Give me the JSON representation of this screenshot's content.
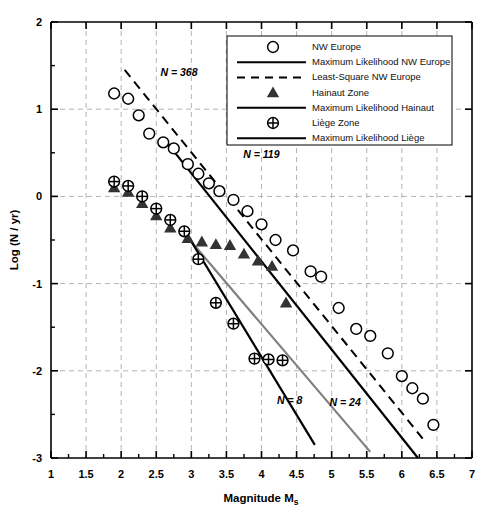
{
  "chart_data": {
    "type": "scatter",
    "title": "",
    "xlabel": "Magnitude Ms",
    "ylabel": "Log (N / yr)",
    "xlim": [
      1,
      7
    ],
    "ylim": [
      -3,
      2
    ],
    "xticks": [
      "1",
      "1.5",
      "2",
      "2.5",
      "3",
      "3.5",
      "4",
      "4.5",
      "5",
      "5.5",
      "6",
      "6.5",
      "7"
    ],
    "yticks": [
      "2",
      "1",
      "0",
      "-1",
      "-2",
      "-3"
    ],
    "grid": true,
    "legend_position": "top-right",
    "series": [
      {
        "name": "NW Europe",
        "marker": "open-circle",
        "color": "#000000",
        "points": [
          [
            1.9,
            1.18
          ],
          [
            2.1,
            1.12
          ],
          [
            2.25,
            0.93
          ],
          [
            2.4,
            0.72
          ],
          [
            2.6,
            0.62
          ],
          [
            2.75,
            0.55
          ],
          [
            2.95,
            0.37
          ],
          [
            3.1,
            0.26
          ],
          [
            3.25,
            0.15
          ],
          [
            3.4,
            0.06
          ],
          [
            3.6,
            -0.04
          ],
          [
            3.8,
            -0.17
          ],
          [
            4.0,
            -0.32
          ],
          [
            4.2,
            -0.5
          ],
          [
            4.45,
            -0.62
          ],
          [
            4.7,
            -0.86
          ],
          [
            4.85,
            -0.92
          ],
          [
            5.1,
            -1.28
          ],
          [
            5.35,
            -1.52
          ],
          [
            5.55,
            -1.6
          ],
          [
            5.8,
            -1.8
          ],
          [
            6.0,
            -2.06
          ],
          [
            6.15,
            -2.2
          ],
          [
            6.3,
            -2.32
          ],
          [
            6.45,
            -2.62
          ]
        ]
      },
      {
        "name": "Hainaut Zone",
        "marker": "filled-triangle",
        "color": "#333333",
        "points": [
          [
            1.9,
            0.1
          ],
          [
            2.1,
            0.05
          ],
          [
            2.3,
            -0.08
          ],
          [
            2.5,
            -0.22
          ],
          [
            2.7,
            -0.36
          ],
          [
            2.95,
            -0.48
          ],
          [
            3.15,
            -0.52
          ],
          [
            3.35,
            -0.55
          ],
          [
            3.55,
            -0.56
          ],
          [
            3.75,
            -0.66
          ],
          [
            3.95,
            -0.74
          ],
          [
            4.15,
            -0.8
          ],
          [
            4.35,
            -1.22
          ]
        ]
      },
      {
        "name": "Liège Zone",
        "marker": "crossed-circle",
        "color": "#000000",
        "points": [
          [
            1.9,
            0.17
          ],
          [
            2.1,
            0.12
          ],
          [
            2.3,
            0.0
          ],
          [
            2.5,
            -0.14
          ],
          [
            2.7,
            -0.27
          ],
          [
            2.9,
            -0.4
          ],
          [
            3.1,
            -0.72
          ],
          [
            3.35,
            -1.22
          ],
          [
            3.6,
            -1.46
          ],
          [
            3.9,
            -1.86
          ],
          [
            4.1,
            -1.87
          ],
          [
            4.3,
            -1.88
          ]
        ]
      }
    ],
    "fit_lines": [
      {
        "name": "Maximum Likelihood NW Europe",
        "style": "solid",
        "color": "#000000",
        "width": 2.2,
        "from": [
          2.65,
          0.62
        ],
        "to": [
          6.23,
          -3.0
        ]
      },
      {
        "name": "Least-Square NW Europe",
        "style": "dashed",
        "color": "#000000",
        "width": 2.0,
        "from": [
          2.05,
          1.45
        ],
        "to": [
          6.3,
          -2.78
        ]
      },
      {
        "name": "Maximum Likelihood Hainaut",
        "style": "solid",
        "color": "#808080",
        "width": 2.2,
        "from": [
          3.0,
          -0.52
        ],
        "to": [
          5.55,
          -2.93
        ]
      },
      {
        "name": "Maximum Likelihood Liège",
        "style": "solid",
        "color": "#000000",
        "width": 2.2,
        "from": [
          2.98,
          -0.49
        ],
        "to": [
          4.76,
          -2.85
        ]
      }
    ],
    "annotations": [
      {
        "text": "N = 368",
        "x": 2.56,
        "y": 1.38
      },
      {
        "text": "N = 119",
        "x": 3.74,
        "y": 0.44
      },
      {
        "text": "N = 8",
        "x": 4.22,
        "y": -2.38
      },
      {
        "text": "N = 24",
        "x": 4.97,
        "y": -2.4
      }
    ]
  },
  "legend": {
    "entries": [
      {
        "label": "NW Europe",
        "symbol": "open-circle"
      },
      {
        "label": "Maximum Likelihood NW Europe",
        "symbol": "solid-line"
      },
      {
        "label": "Least-Square NW Europe",
        "symbol": "dashed-line"
      },
      {
        "label": "Hainaut Zone",
        "symbol": "filled-triangle"
      },
      {
        "label": "Maximum Likelihood Hainaut",
        "symbol": "solid-line"
      },
      {
        "label": "Liège Zone",
        "symbol": "crossed-circle"
      },
      {
        "label": "Maximum Likelihood Liège",
        "symbol": "solid-line"
      }
    ]
  },
  "colors": {
    "axis": "#000000",
    "grid": "#b4b4b4",
    "hainaut_line": "#808080",
    "marker": "#000000"
  }
}
